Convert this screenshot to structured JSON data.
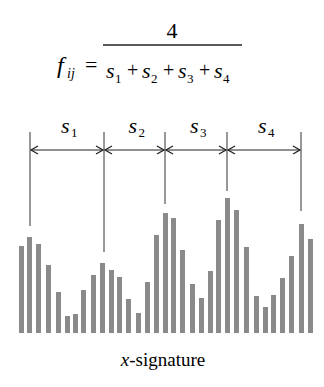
{
  "formula": {
    "lhs": "f",
    "lhs_sub": "ij",
    "equals": "=",
    "numerator": "4",
    "denominator_terms": [
      {
        "var": "s",
        "sub": "1"
      },
      {
        "var": "s",
        "sub": "2"
      },
      {
        "var": "s",
        "sub": "3"
      },
      {
        "var": "s",
        "sub": "4"
      }
    ],
    "operator": "+"
  },
  "segments": [
    {
      "label": "s",
      "sub": "1",
      "x_start": 30,
      "x_end": 104
    },
    {
      "label": "s",
      "sub": "2",
      "x_start": 104,
      "x_end": 165
    },
    {
      "label": "s",
      "sub": "3",
      "x_start": 165,
      "x_end": 227
    },
    {
      "label": "s",
      "sub": "4",
      "x_start": 227,
      "x_end": 301
    }
  ],
  "peak_lines": [
    {
      "x": 30,
      "y_bottom": 226
    },
    {
      "x": 104,
      "y_bottom": 252
    },
    {
      "x": 165,
      "y_bottom": 204
    },
    {
      "x": 227,
      "y_bottom": 191
    },
    {
      "x": 301,
      "y_bottom": 211
    }
  ],
  "signature": {
    "caption_var": "x",
    "caption_rest": "-signature",
    "bar_color": "#8a8a8a",
    "baseline_y": 333,
    "bars": [
      {
        "x": 19,
        "top": 246
      },
      {
        "x": 27,
        "top": 237
      },
      {
        "x": 36,
        "top": 244
      },
      {
        "x": 46,
        "top": 265
      },
      {
        "x": 56,
        "top": 292
      },
      {
        "x": 65,
        "top": 316
      },
      {
        "x": 73,
        "top": 314
      },
      {
        "x": 81,
        "top": 290
      },
      {
        "x": 91,
        "top": 275
      },
      {
        "x": 100,
        "top": 263
      },
      {
        "x": 109,
        "top": 270
      },
      {
        "x": 117,
        "top": 277
      },
      {
        "x": 126,
        "top": 299
      },
      {
        "x": 136,
        "top": 313
      },
      {
        "x": 145,
        "top": 282
      },
      {
        "x": 154,
        "top": 235
      },
      {
        "x": 163,
        "top": 213
      },
      {
        "x": 171,
        "top": 218
      },
      {
        "x": 180,
        "top": 250
      },
      {
        "x": 190,
        "top": 284
      },
      {
        "x": 199,
        "top": 298
      },
      {
        "x": 208,
        "top": 271
      },
      {
        "x": 216,
        "top": 220
      },
      {
        "x": 225,
        "top": 198
      },
      {
        "x": 234,
        "top": 210
      },
      {
        "x": 244,
        "top": 247
      },
      {
        "x": 254,
        "top": 296
      },
      {
        "x": 263,
        "top": 307
      },
      {
        "x": 271,
        "top": 295
      },
      {
        "x": 280,
        "top": 278
      },
      {
        "x": 289,
        "top": 256
      },
      {
        "x": 299,
        "top": 224
      },
      {
        "x": 308,
        "top": 239
      }
    ]
  }
}
